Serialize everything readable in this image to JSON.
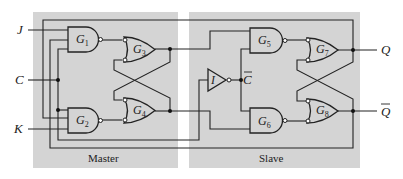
{
  "figure": {
    "type": "master-slave JK flip-flop",
    "sections": {
      "master_label": "Master",
      "slave_label": "Slave"
    },
    "inputs": {
      "j": "J",
      "c": "C",
      "k": "K"
    },
    "outputs": {
      "q": "Q",
      "q_bar": "Q"
    },
    "internal_signals": {
      "c_bar": "C"
    },
    "gates": {
      "g1": {
        "name": "G",
        "index": "1",
        "type": "NAND"
      },
      "g2": {
        "name": "G",
        "index": "2",
        "type": "NAND"
      },
      "g3": {
        "name": "G",
        "index": "3",
        "type": "OR with inverted inputs"
      },
      "g4": {
        "name": "G",
        "index": "4",
        "type": "OR with inverted inputs"
      },
      "g5": {
        "name": "G",
        "index": "5",
        "type": "NAND"
      },
      "g6": {
        "name": "G",
        "index": "6",
        "type": "NAND"
      },
      "g7": {
        "name": "G",
        "index": "7",
        "type": "OR with inverted inputs"
      },
      "g8": {
        "name": "G",
        "index": "8",
        "type": "OR with inverted inputs"
      },
      "inverter": {
        "name": "I",
        "type": "NOT"
      }
    },
    "colors": {
      "panel": "#d4d4d4",
      "line": "#222222",
      "background": "#ffffff"
    }
  }
}
